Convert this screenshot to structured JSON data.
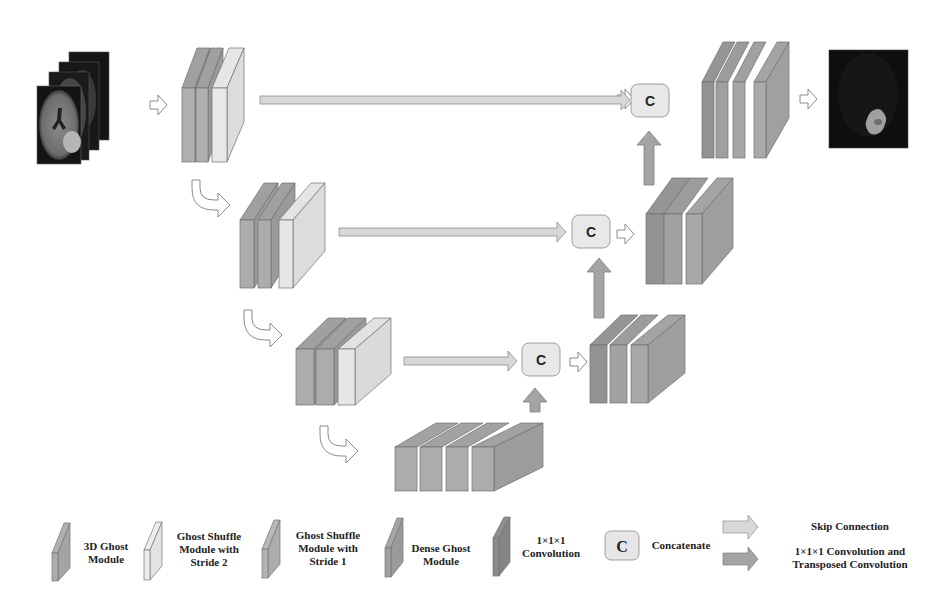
{
  "diagram": {
    "type": "3D U-Net style encoder-decoder architecture",
    "colors": {
      "ghost_3d": "#a8a8a8",
      "ghost_shuffle_s2": "#e2e2e2",
      "ghost_shuffle_s1": "#b4b4b4",
      "dense_ghost": "#9e9e9e",
      "conv_1x1x1": "#8c8c8c",
      "concat_fill": "#e6e6e6",
      "skip_arrow": "#d8d8d8",
      "up_arrow": "#a4a4a4",
      "outline": "#6e6e6e"
    },
    "concat_symbol": "C",
    "input_label": "input-mri-slices",
    "output_label": "output-segmentation"
  },
  "legend": {
    "items": [
      {
        "id": "ghost-3d",
        "lines": [
          "3D Ghost",
          "Module"
        ]
      },
      {
        "id": "ghost-shuffle-s2",
        "lines": [
          "Ghost Shuffle",
          "Module with",
          "Stride 2"
        ]
      },
      {
        "id": "ghost-shuffle-s1",
        "lines": [
          "Ghost Shuffle",
          "Module with",
          "Stride 1"
        ]
      },
      {
        "id": "dense-ghost",
        "lines": [
          "Dense Ghost",
          "Module"
        ]
      },
      {
        "id": "conv-1x1x1",
        "lines": [
          "1×1×1",
          "Convolution"
        ]
      },
      {
        "id": "concatenate",
        "symbol": "C",
        "lines": [
          "Concatenate"
        ]
      },
      {
        "id": "skip-connection",
        "lines": [
          "Skip Connection"
        ]
      },
      {
        "id": "conv-transposed",
        "lines": [
          "1×1×1 Convolution and",
          "Transposed Convolution"
        ]
      }
    ]
  }
}
